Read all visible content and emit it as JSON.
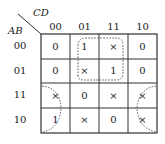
{
  "kmap": {
    "row_variable": "AB",
    "col_variable": "CD",
    "col_headers": [
      "00",
      "01",
      "11",
      "10"
    ],
    "row_headers": [
      "00",
      "01",
      "11",
      "10"
    ],
    "cells": [
      [
        "0",
        "1",
        "×",
        "0"
      ],
      [
        "0",
        "×",
        "1",
        "0"
      ],
      [
        "×",
        "0",
        "×",
        "×"
      ],
      [
        "1",
        "×",
        "0",
        "×"
      ]
    ],
    "groupings": [
      {
        "name": "center-group",
        "covers": "rows 00-01, cols 01-11",
        "style": "dashed"
      },
      {
        "name": "corner-group",
        "covers": "rows 11-10, cols 00 and 10 (wrap-around)",
        "style": "dashed"
      }
    ]
  }
}
